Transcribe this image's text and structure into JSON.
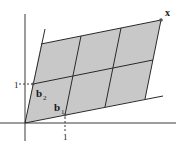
{
  "diagram": {
    "type": "lattice-parallelogram",
    "fill_color": "#c8c8c8",
    "line_color": "#2a2a2a",
    "axis_color": "#3a3a3a",
    "labels": {
      "x_point": "x",
      "b1": "b",
      "b1_sub": "1",
      "b2": "b",
      "b2_sub": "2",
      "x_tick": "1",
      "y_tick": "1"
    },
    "grid": {
      "columns": 3,
      "rows": 2
    }
  }
}
